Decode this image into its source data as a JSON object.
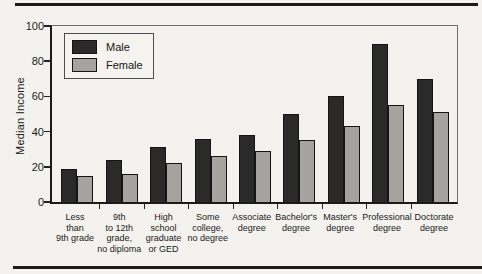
{
  "chart_data": {
    "type": "bar",
    "title": "",
    "xlabel": "",
    "ylabel": "Median Income",
    "ylim": [
      0,
      100
    ],
    "yticks": [
      0,
      20,
      40,
      60,
      80,
      100
    ],
    "grid": false,
    "legend_position": "top-left",
    "categories": [
      "Less\nthan\n9th grade",
      "9th\nto 12th\ngrade,\nno diploma",
      "High\nschool\ngraduate\nor GED",
      "Some\ncollege,\nno degree",
      "Associate\ndegree",
      "Bachelor's\ndegree",
      "Master's\ndegree",
      "Professional\ndegree",
      "Doctorate\ndegree"
    ],
    "series": [
      {
        "name": "Male",
        "color": "#2a2a2a",
        "values": [
          19,
          24,
          31,
          36,
          38,
          50,
          60,
          90,
          70
        ]
      },
      {
        "name": "Female",
        "color": "#a5a3a0",
        "values": [
          15,
          16,
          22,
          26,
          29,
          35,
          43,
          55,
          51
        ]
      }
    ]
  }
}
